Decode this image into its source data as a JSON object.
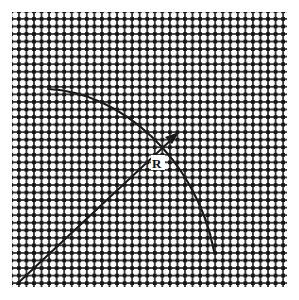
{
  "figure": {
    "background_color": "#ffffff",
    "canvas": {
      "width": 299,
      "height": 300
    }
  },
  "mesh": {
    "name": "square-mesh-grid",
    "description": "Regular square woven mesh of dark nodes joined by thin lines",
    "node_color": "#1c1c1c",
    "line_color": "#2a2a2a",
    "cell_pitch_px": 7.55,
    "node_size_px": 3.6,
    "bounds": {
      "x": 12,
      "y": 12,
      "width": 275,
      "height": 275
    },
    "columns": 37,
    "rows": 37
  },
  "arc": {
    "name": "curved-arc",
    "label": "",
    "stroke_color": "#1a1a1a",
    "stroke_width": 2.1,
    "start_point": {
      "x": 48,
      "y": 89
    },
    "end_point": {
      "x": 214,
      "y": 251
    },
    "control_points": [
      {
        "x": 120,
        "y": 92
      },
      {
        "x": 196,
        "y": 158
      }
    ]
  },
  "radius_arrow": {
    "name": "radius-arrow",
    "label": "R",
    "stroke_color": "#1a1a1a",
    "stroke_width": 2.0,
    "tail_point": {
      "x": 17,
      "y": 284
    },
    "head_point": {
      "x": 178,
      "y": 133
    },
    "label_position": {
      "x": 153,
      "y": 168
    }
  },
  "colors": {
    "ink": "#1a1a1a",
    "paper": "#ffffff",
    "mesh_node": "#1c1c1c"
  }
}
